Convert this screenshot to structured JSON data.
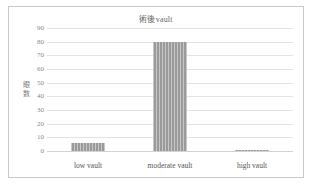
{
  "chart_data": {
    "type": "bar",
    "title": "術後vault",
    "xlabel": "",
    "ylabel": "眼数",
    "ylabel_chars": [
      "眼",
      "数"
    ],
    "categories": [
      "low vault",
      "moderate vault",
      "high vault"
    ],
    "values": [
      6,
      80,
      1
    ],
    "ylim": [
      0,
      90
    ],
    "yticks": [
      90,
      80,
      70,
      60,
      50,
      40,
      30,
      20,
      10,
      0
    ],
    "grid": true,
    "legend": false,
    "bar_color": "#9a9a9a",
    "gridline_color": "#e3e3e3",
    "frame_color": "#c8c8c8",
    "background": "#ffffff"
  }
}
